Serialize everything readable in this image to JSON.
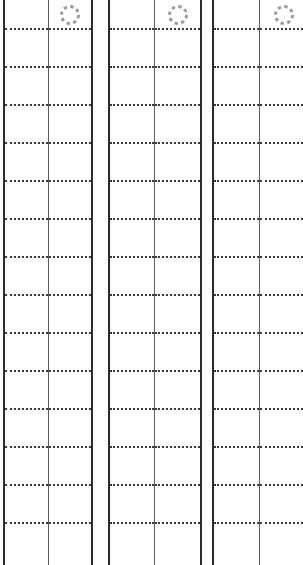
{
  "document": {
    "title": "Ruled Form Sheet",
    "kind": "blank-ruled-form",
    "page_width": 303,
    "page_height": 565,
    "background_color": "#ffffff"
  },
  "style": {
    "group_border_color": "#2b2b2b",
    "group_border_width": 2,
    "divider_color": "#5a5a5a",
    "divider_width": 1,
    "rule_color": "#3a3a3a",
    "rule_width": 2,
    "rule_style": "dotted",
    "icon_color": "#9a9a9a"
  },
  "rules": {
    "count": 14,
    "spacing": 38,
    "first_y": 28,
    "y_positions": [
      28,
      66,
      104,
      142,
      180,
      218,
      256,
      294,
      332,
      370,
      408,
      446,
      484,
      522
    ]
  },
  "groups": [
    {
      "name": "column-group-1",
      "left": 3,
      "width": 90,
      "clipped": false,
      "cells": [
        {
          "name": "left-cell",
          "width": 44,
          "content": "",
          "icon": null
        },
        {
          "name": "right-cell",
          "width": 42,
          "content": "",
          "icon": "dashed-circle-icon"
        }
      ]
    },
    {
      "name": "column-group-2",
      "left": 108,
      "width": 94,
      "clipped": false,
      "cells": [
        {
          "name": "left-cell",
          "width": 45,
          "content": "",
          "icon": null
        },
        {
          "name": "right-cell",
          "width": 45,
          "content": "",
          "icon": "dashed-circle-icon"
        }
      ]
    },
    {
      "name": "column-group-3",
      "left": 212,
      "width": 95,
      "clipped": true,
      "cells": [
        {
          "name": "left-cell",
          "width": 46,
          "content": "",
          "icon": null
        },
        {
          "name": "right-cell",
          "width": 47,
          "content": "",
          "icon": "dashed-circle-icon"
        }
      ]
    }
  ],
  "icons": {
    "dashed_circle": {
      "name": "dashed-circle-icon",
      "color": "#9a9a9a",
      "segments": 8,
      "radius": 8.5,
      "stroke_width": 3
    }
  }
}
